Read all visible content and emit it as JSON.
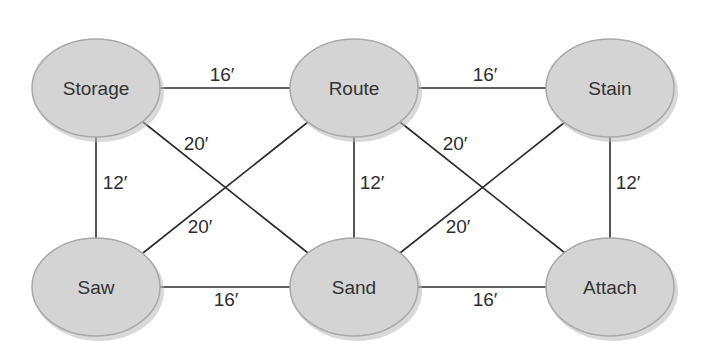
{
  "diagram": {
    "type": "weighted-graph",
    "colors": {
      "node_fill": "#d4d4d4",
      "node_stroke": "#a8a8a8",
      "edge": "#2b2b2b",
      "text": "#333333",
      "background": "#ffffff"
    },
    "nodes": [
      {
        "id": "storage",
        "label": "Storage"
      },
      {
        "id": "route",
        "label": "Route"
      },
      {
        "id": "stain",
        "label": "Stain"
      },
      {
        "id": "saw",
        "label": "Saw"
      },
      {
        "id": "sand",
        "label": "Sand"
      },
      {
        "id": "attach",
        "label": "Attach"
      }
    ],
    "edges": [
      {
        "from": "Storage",
        "to": "Route",
        "label": "16′"
      },
      {
        "from": "Route",
        "to": "Stain",
        "label": "16′"
      },
      {
        "from": "Saw",
        "to": "Sand",
        "label": "16′"
      },
      {
        "from": "Sand",
        "to": "Attach",
        "label": "16′"
      },
      {
        "from": "Storage",
        "to": "Saw",
        "label": "12′"
      },
      {
        "from": "Route",
        "to": "Sand",
        "label": "12′"
      },
      {
        "from": "Stain",
        "to": "Attach",
        "label": "12′"
      },
      {
        "from": "Storage",
        "to": "Sand",
        "label": "20′"
      },
      {
        "from": "Route",
        "to": "Saw",
        "label": "20′"
      },
      {
        "from": "Route",
        "to": "Attach",
        "label": "20′"
      },
      {
        "from": "Stain",
        "to": "Sand",
        "label": "20′"
      }
    ]
  }
}
